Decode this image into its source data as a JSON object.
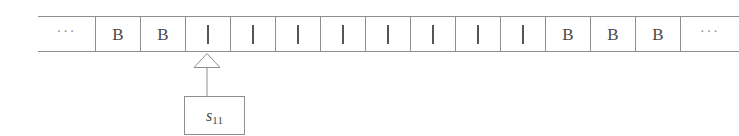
{
  "figure": {
    "kind": "turing-machine-tape-diagram",
    "colors": {
      "line": "#8e8e8e",
      "glyph": "#4a4a4a",
      "background": "#ffffff"
    },
    "tape": {
      "cells": [
        {
          "symbol": "···",
          "type": "ellipsis"
        },
        {
          "symbol": "B",
          "type": "blank"
        },
        {
          "symbol": "B",
          "type": "blank"
        },
        {
          "symbol": "|",
          "type": "tally"
        },
        {
          "symbol": "|",
          "type": "tally"
        },
        {
          "symbol": "|",
          "type": "tally"
        },
        {
          "symbol": "|",
          "type": "tally"
        },
        {
          "symbol": "|",
          "type": "tally"
        },
        {
          "symbol": "|",
          "type": "tally"
        },
        {
          "symbol": "|",
          "type": "tally"
        },
        {
          "symbol": "|",
          "type": "tally"
        },
        {
          "symbol": "B",
          "type": "blank"
        },
        {
          "symbol": "B",
          "type": "blank"
        },
        {
          "symbol": "B",
          "type": "blank"
        },
        {
          "symbol": "···",
          "type": "ellipsis"
        }
      ]
    },
    "head": {
      "pointer_icon": "up-triangle-outline-icon",
      "points_at_cell_index": 3
    },
    "state": {
      "symbol": "s",
      "subscript": "11",
      "full_label": "s11"
    }
  }
}
